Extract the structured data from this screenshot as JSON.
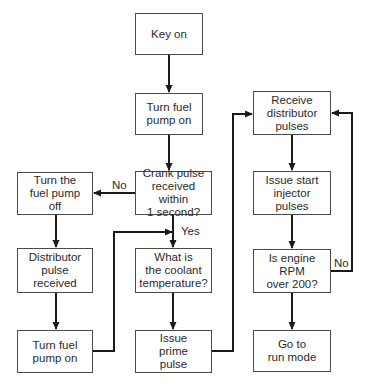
{
  "diagram": {
    "type": "flowchart",
    "nodes": {
      "key_on": "Key on",
      "turn_pump_on_top": "Turn fuel\npump on",
      "crank_pulse": "Crank pulse\nreceived within\n1 second?",
      "turn_pump_off": "Turn the\nfuel pump\noff",
      "distributor_pulse": "Distributor\npulse\nreceived",
      "turn_pump_on_left": "Turn fuel\npump on",
      "coolant_temp": "What is\nthe coolant\ntemperature?",
      "prime_pulse": "Issue\nprime\npulse",
      "receive_distributor": "Receive\ndistributor\npulses",
      "start_injector": "Issue start\ninjector\npulses",
      "rpm_check": "Is engine\nRPM\nover 200?",
      "run_mode": "Go to\nrun mode"
    },
    "edge_labels": {
      "crank_no": "No",
      "crank_yes": "Yes",
      "rpm_no": "No"
    },
    "edges": [
      {
        "from": "key_on",
        "to": "turn_pump_on_top"
      },
      {
        "from": "turn_pump_on_top",
        "to": "crank_pulse"
      },
      {
        "from": "crank_pulse",
        "to": "turn_pump_off",
        "label": "No"
      },
      {
        "from": "crank_pulse",
        "to": "coolant_temp",
        "label": "Yes"
      },
      {
        "from": "turn_pump_off",
        "to": "distributor_pulse"
      },
      {
        "from": "distributor_pulse",
        "to": "turn_pump_on_left"
      },
      {
        "from": "turn_pump_on_left",
        "to": "coolant_temp"
      },
      {
        "from": "coolant_temp",
        "to": "prime_pulse"
      },
      {
        "from": "prime_pulse",
        "to": "receive_distributor"
      },
      {
        "from": "receive_distributor",
        "to": "start_injector"
      },
      {
        "from": "start_injector",
        "to": "rpm_check"
      },
      {
        "from": "rpm_check",
        "to": "receive_distributor",
        "label": "No"
      },
      {
        "from": "rpm_check",
        "to": "run_mode"
      }
    ],
    "colors": {
      "line": "#1a1a1a",
      "box_border": "#4a4a4a",
      "text": "#2a2a2a",
      "background": "#ffffff"
    }
  }
}
